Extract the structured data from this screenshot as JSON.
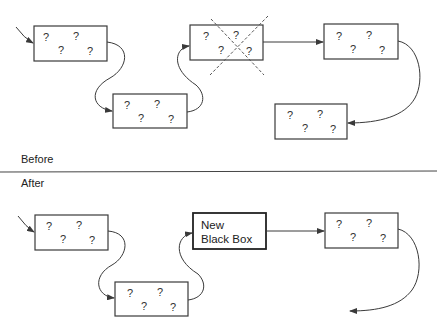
{
  "labels": {
    "before": "Before",
    "after": "After"
  },
  "box_glyph": "?",
  "new_box": {
    "line1": "New",
    "line2": "Black Box"
  },
  "colors": {
    "stroke": "#3a3a3a",
    "background": "#ffffff",
    "cross": "#555555"
  },
  "before": {
    "boxes": [
      {
        "id": "b1",
        "x": 34,
        "y": 26,
        "w": 73,
        "h": 35
      },
      {
        "id": "b2",
        "x": 113,
        "y": 94,
        "w": 74,
        "h": 34
      },
      {
        "id": "b3",
        "x": 190,
        "y": 25,
        "w": 73,
        "h": 35,
        "crossed_out": true
      },
      {
        "id": "b4",
        "x": 324,
        "y": 24,
        "w": 74,
        "h": 35
      },
      {
        "id": "b5",
        "x": 275,
        "y": 104,
        "w": 72,
        "h": 35
      }
    ]
  },
  "after": {
    "boxes": [
      {
        "id": "a1",
        "x": 35,
        "y": 215,
        "w": 73,
        "h": 35
      },
      {
        "id": "a2",
        "x": 115,
        "y": 282,
        "w": 73,
        "h": 34
      },
      {
        "id": "a3",
        "x": 193,
        "y": 213,
        "w": 73,
        "h": 36,
        "new": true
      },
      {
        "id": "a4",
        "x": 325,
        "y": 213,
        "w": 73,
        "h": 35
      }
    ]
  }
}
